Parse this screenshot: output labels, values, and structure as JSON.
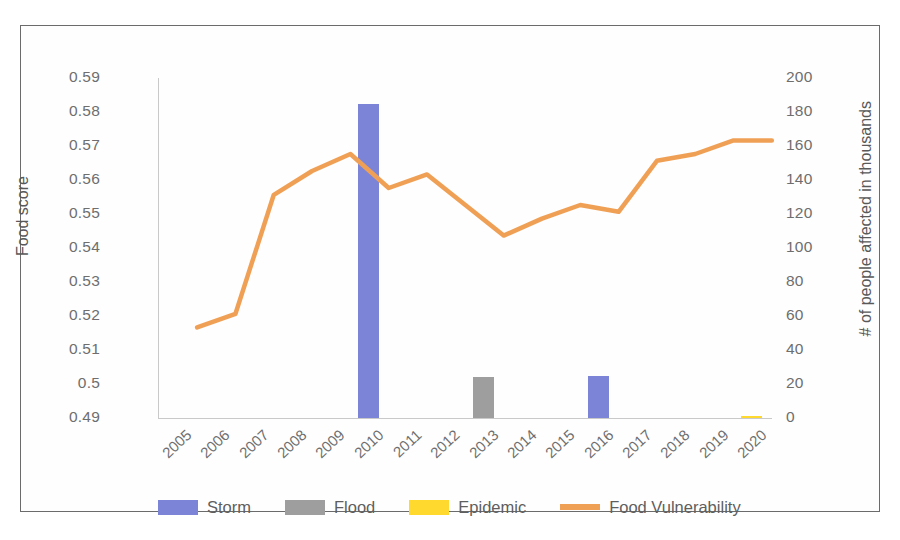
{
  "chart_data": {
    "type": "bar",
    "title": "",
    "subtitle": "",
    "xlabel": "",
    "ylabel": "Food score",
    "y2label": "# of people affected in thousands",
    "grid": false,
    "legend_position": "bottom",
    "categories": [
      "2005",
      "2006",
      "2007",
      "2008",
      "2009",
      "2010",
      "2011",
      "2012",
      "2013",
      "2014",
      "2015",
      "2016",
      "2017",
      "2018",
      "2019",
      "2020"
    ],
    "ylim": [
      0.49,
      0.59
    ],
    "yticks": [
      "0.59",
      "0.58",
      "0.57",
      "0.56",
      "0.55",
      "0.54",
      "0.53",
      "0.52",
      "0.51",
      "0.5",
      "0.49"
    ],
    "ytick_values": [
      0.59,
      0.58,
      0.57,
      0.56,
      0.55,
      0.54,
      0.53,
      0.52,
      0.51,
      0.5,
      0.49
    ],
    "y2lim": [
      0,
      200
    ],
    "y2ticks": [
      "200",
      "180",
      "160",
      "140",
      "120",
      "100",
      "80",
      "60",
      "40",
      "20",
      "0"
    ],
    "y2tick_values": [
      200,
      180,
      160,
      140,
      120,
      100,
      80,
      60,
      40,
      20,
      0
    ],
    "series": [
      {
        "name": "Storm",
        "type": "bar",
        "axis": "right",
        "color": "#7b84d6",
        "values": [
          0,
          0,
          0,
          0,
          0,
          185,
          0,
          0,
          0,
          0,
          0,
          25,
          0,
          0,
          0,
          0
        ]
      },
      {
        "name": "Flood",
        "type": "bar",
        "axis": "right",
        "color": "#9e9e9e",
        "values": [
          0,
          0,
          0,
          0,
          0,
          0,
          0,
          0,
          24,
          0,
          0,
          0,
          0,
          0,
          0,
          0
        ]
      },
      {
        "name": "Epidemic",
        "type": "bar",
        "axis": "right",
        "color": "#ffd92e",
        "values": [
          0,
          0,
          0,
          0,
          0,
          0,
          0,
          0,
          0,
          0,
          0,
          0,
          0,
          0,
          0,
          1
        ]
      },
      {
        "name": "Food Vulnerability",
        "type": "line",
        "axis": "left",
        "color": "#f0a055",
        "values": [
          0.524,
          0.528,
          0.563,
          0.57,
          0.575,
          0.565,
          0.569,
          0.56,
          0.551,
          0.556,
          0.56,
          0.558,
          0.573,
          0.575,
          0.579,
          0.579
        ]
      }
    ]
  },
  "legend": {
    "items": [
      {
        "label": "Storm",
        "color": "#7b84d6",
        "marker": "swatch"
      },
      {
        "label": "Flood",
        "color": "#9e9e9e",
        "marker": "swatch"
      },
      {
        "label": "Epidemic",
        "color": "#ffd92e",
        "marker": "swatch"
      },
      {
        "label": "Food Vulnerability",
        "color": "#f0a055",
        "marker": "line"
      }
    ]
  },
  "colors": {
    "storm": "#7b84d6",
    "flood": "#9e9e9e",
    "epidemic": "#ffd92e",
    "food_vulnerability": "#f0a055",
    "axis_text": "#6e6e6e",
    "frame": "#6b6b6b",
    "background": "#ffffff"
  }
}
